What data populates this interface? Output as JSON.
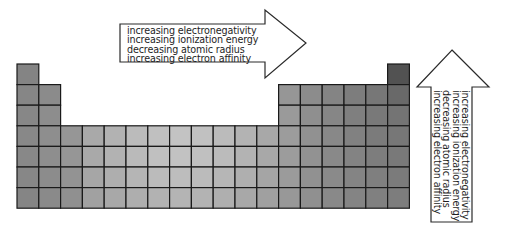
{
  "figure": {
    "type": "periodic-table-trends",
    "grid": {
      "columns": 18,
      "rows": 7,
      "origin_x": 17,
      "origin_y": 64,
      "cell_width": 21.8,
      "cell_height": 20.6,
      "row_columns": [
        [
          1,
          18
        ],
        [
          1,
          2,
          13,
          14,
          15,
          16,
          17,
          18
        ],
        [
          1,
          2,
          13,
          14,
          15,
          16,
          17,
          18
        ],
        [
          1,
          2,
          3,
          4,
          5,
          6,
          7,
          8,
          9,
          10,
          11,
          12,
          13,
          14,
          15,
          16,
          17,
          18
        ],
        [
          1,
          2,
          3,
          4,
          5,
          6,
          7,
          8,
          9,
          10,
          11,
          12,
          13,
          14,
          15,
          16,
          17,
          18
        ],
        [
          1,
          2,
          3,
          4,
          5,
          6,
          7,
          8,
          9,
          10,
          11,
          12,
          13,
          14,
          15,
          16,
          17,
          18
        ],
        [
          1,
          2,
          3,
          4,
          5,
          6,
          7,
          8,
          9,
          10,
          11,
          12,
          13,
          14,
          15,
          16,
          17,
          18
        ]
      ],
      "shading": {
        "lightest": "#c4c4c4",
        "mid": "#8e8e8e",
        "darkest": "#505050",
        "line_color": "#1a1a1a"
      }
    },
    "horizontal_arrow": {
      "direction": "right",
      "label": "across a period",
      "lines": [
        "increasing electronegativity",
        "increasing ionization energy",
        "decreasing atomic radius",
        "increasing electron affinity"
      ]
    },
    "vertical_arrow": {
      "direction": "up",
      "label": "up a group",
      "lines": [
        "increasing electronegativity",
        "increasing ionization energy",
        "decreasing atomic radius",
        "increasing electron affinity"
      ]
    }
  }
}
